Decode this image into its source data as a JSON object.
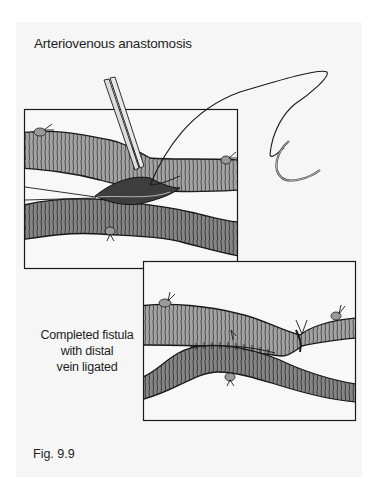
{
  "figure": {
    "title": "Arteriovenous anastomosis",
    "side_caption_lines": [
      "Completed fistula",
      "with distal",
      "vein ligated"
    ],
    "figure_label": "Fig. 9.9",
    "panels": [
      {
        "id": "panel-1",
        "description": "Side-to-side anastomosis being sutured; forceps holding vessel wall, curved suture needle"
      },
      {
        "id": "panel-2",
        "description": "Completed fistula with distal vein ligated"
      }
    ],
    "colors": {
      "page_bg": "#f6f6f6",
      "artery": "#9a9a9a",
      "vein": "#7f7f7f",
      "outline": "#1a1a1a",
      "panel_bg": "#f8f8f8"
    }
  }
}
